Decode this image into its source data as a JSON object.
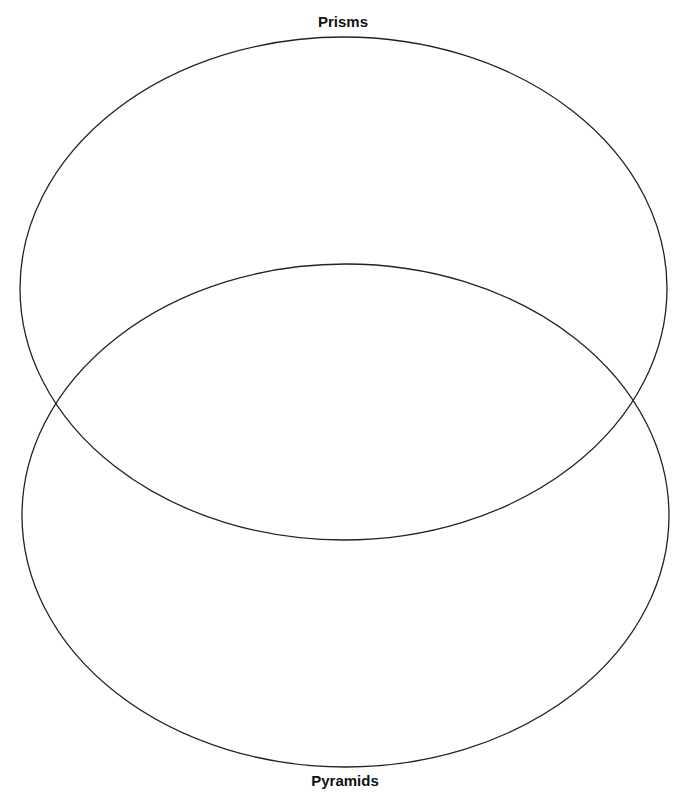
{
  "diagram": {
    "type": "venn",
    "sets": [
      {
        "name": "prisms",
        "label": "Prisms",
        "shape": "ellipse",
        "cx": 343.5,
        "cy": 288.5,
        "rx": 323.5,
        "ry": 251.5
      },
      {
        "name": "pyramids",
        "label": "Pyramids",
        "shape": "ellipse",
        "cx": 345.5,
        "cy": 515.5,
        "rx": 323.5,
        "ry": 251.5
      }
    ],
    "stroke_color": "#222222",
    "background_color": "#ffffff"
  }
}
